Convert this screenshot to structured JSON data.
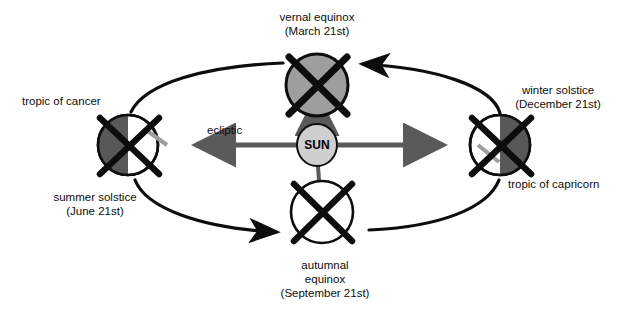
{
  "figure": {
    "background_color": "#ffffff",
    "ink_color": "#0d0d0d",
    "arrow_gray": "#5a5a5a",
    "shade_dark": "#585858",
    "shade_mid": "#9e9e9e",
    "shade_light": "#cfcfcf",
    "white": "#ffffff"
  },
  "center_body": {
    "name": "SUN",
    "label": "SUN",
    "cx": 317,
    "cy": 145,
    "rx": 20,
    "ry": 21,
    "fill": "#cfcfcf"
  },
  "ecliptic": {
    "label": "ecliptic",
    "label_x": 207,
    "label_y": 123,
    "arrow_color": "#5a5a5a"
  },
  "positions": [
    {
      "id": "vernal-equinox",
      "label_line1": "vernal equinox",
      "label_line2": "(March 21st)",
      "label_x": 232,
      "label_y": 10,
      "label_width": 170,
      "cx": 317,
      "cy": 85,
      "rx": 31,
      "ry": 31,
      "shading": "full",
      "fill": "#9e9e9e",
      "secondary_labels": []
    },
    {
      "id": "summer-solstice",
      "label_line1": "summer solstice",
      "label_line2": "(June 21st)",
      "label_x": 15,
      "label_y": 190,
      "label_width": 160,
      "cx": 128,
      "cy": 145,
      "rx": 30,
      "ry": 31,
      "shading": "left",
      "fill": "#585858",
      "secondary_labels": [
        {
          "text": "tropic of cancer",
          "x": 22,
          "y": 94,
          "align": "left"
        }
      ]
    },
    {
      "id": "autumnal-equinox",
      "label_line1": "autumnal",
      "label_line2": "equinox",
      "label_line3": "(September 21st)",
      "label_x": 245,
      "label_y": 258,
      "label_width": 160,
      "cx": 322,
      "cy": 212,
      "rx": 31,
      "ry": 31,
      "shading": "none",
      "fill": "#ffffff",
      "secondary_labels": []
    },
    {
      "id": "winter-solstice",
      "label_line1": "winter solstice",
      "label_line2": "(December 21st)",
      "label_x": 490,
      "label_y": 83,
      "label_width": 136,
      "cx": 500,
      "cy": 145,
      "rx": 30,
      "ry": 31,
      "shading": "right",
      "fill": "#585858",
      "secondary_labels": [
        {
          "text": "tropic of capricorn",
          "x": 508,
          "y": 177,
          "align": "left"
        }
      ]
    }
  ],
  "orbit": {
    "description": "elliptical orbital path with two directional arrowheads",
    "arrowheads": [
      {
        "position": "top-right",
        "direction": "left"
      },
      {
        "position": "bottom-left",
        "direction": "right"
      }
    ]
  },
  "sun_rays": [
    {
      "id": "ray-up",
      "from": "sun",
      "to": "vernal-equinox",
      "arrowhead": true
    },
    {
      "id": "ray-left",
      "from": "sun",
      "to": "summer-solstice",
      "arrowhead": true
    },
    {
      "id": "ray-right",
      "from": "sun",
      "to": "winter-solstice",
      "arrowhead": true
    },
    {
      "id": "ray-down",
      "from": "sun",
      "to": "autumnal-equinox",
      "arrowhead": false
    }
  ]
}
